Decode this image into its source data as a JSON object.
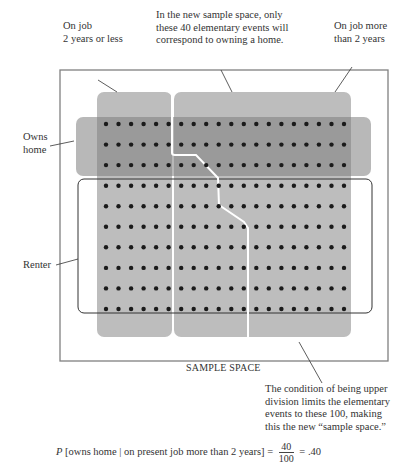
{
  "annotations": {
    "job_short": "On job\n2 years or less",
    "new_space_note": "In the new sample space, only\nthese 40 elementary events will\ncorrespond to owning a home.",
    "job_long": "On job more\nthan 2 years",
    "owns_home": "Owns\nhome",
    "renter": "Renter",
    "sample_space": "SAMPLE SPACE",
    "condition_note": "The condition of being upper\ndivision limits the elementary\nevents to these 100, making\nthis the new “sample space.”"
  },
  "formula": {
    "p": "P",
    "event": "[owns home | on present job more than 2 years] =",
    "numerator": "40",
    "denominator": "100",
    "result": "= .40"
  },
  "grid": {
    "rows": 10,
    "cols": 20,
    "owner_rows": 3,
    "renter_rows": 7,
    "total_events": 200
  },
  "colors": {
    "column_fill": "#b9b9b9",
    "band_fill": "#8f8f8f",
    "dot": "#1a1a1a",
    "frame": "#777777"
  }
}
